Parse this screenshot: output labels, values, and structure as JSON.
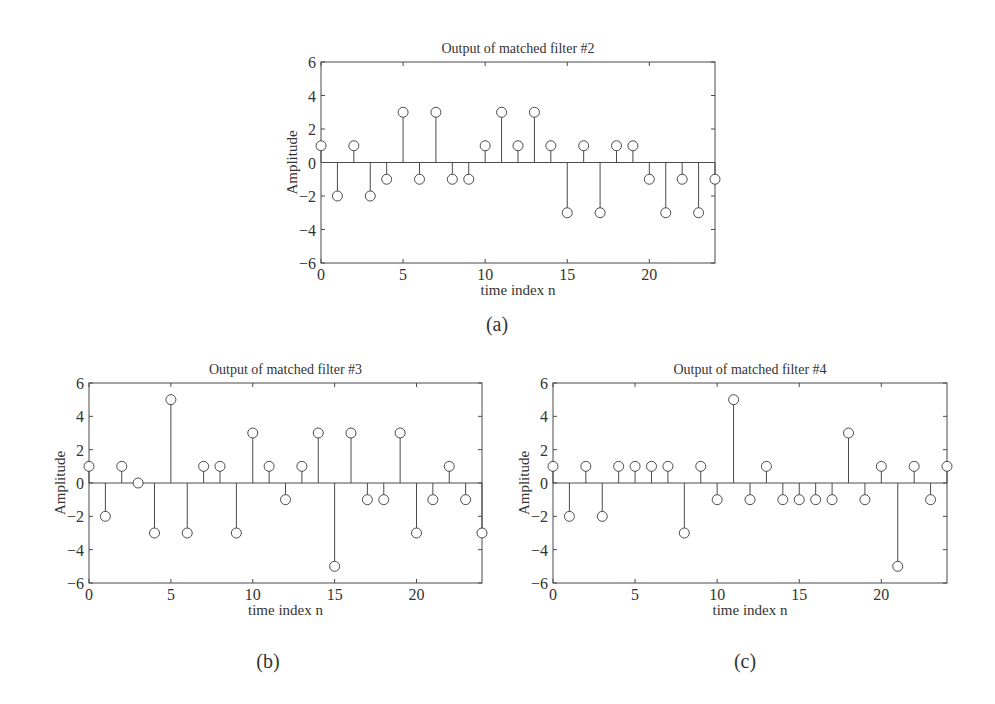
{
  "chart_data": [
    {
      "type": "stem",
      "panel_label": "(a)",
      "title": "Output of matched filter #2",
      "xlabel": "time index n",
      "ylabel": "Amplitude",
      "xlim": [
        0,
        24
      ],
      "ylim": [
        -6,
        6
      ],
      "xticks": [
        0,
        5,
        10,
        15,
        20
      ],
      "yticks": [
        -6,
        -4,
        -2,
        0,
        2,
        4,
        6
      ],
      "grid": false,
      "x": [
        0,
        1,
        2,
        3,
        4,
        5,
        6,
        7,
        8,
        9,
        10,
        11,
        12,
        13,
        14,
        15,
        16,
        17,
        18,
        19,
        20,
        21,
        22,
        23,
        24
      ],
      "values": [
        1,
        -2,
        1,
        -2,
        -1,
        3,
        -1,
        3,
        -1,
        -1,
        1,
        3,
        1,
        3,
        1,
        -3,
        1,
        -3,
        1,
        1,
        -1,
        -3,
        -1,
        -3,
        -1
      ]
    },
    {
      "type": "stem",
      "panel_label": "(b)",
      "title": "Output of matched filter #3",
      "xlabel": "time index n",
      "ylabel": "Amplitude",
      "xlim": [
        0,
        24
      ],
      "ylim": [
        -6,
        6
      ],
      "xticks": [
        0,
        5,
        10,
        15,
        20
      ],
      "yticks": [
        -6,
        -4,
        -2,
        0,
        2,
        4,
        6
      ],
      "grid": false,
      "x": [
        0,
        1,
        2,
        3,
        4,
        5,
        6,
        7,
        8,
        9,
        10,
        11,
        12,
        13,
        14,
        15,
        16,
        17,
        18,
        19,
        20,
        21,
        22,
        23,
        24
      ],
      "values": [
        1,
        -2,
        1,
        0,
        -3,
        5,
        -3,
        1,
        1,
        -3,
        3,
        1,
        -1,
        1,
        3,
        -5,
        3,
        -1,
        -1,
        3,
        -3,
        -1,
        1,
        -1,
        -3
      ]
    },
    {
      "type": "stem",
      "panel_label": "(c)",
      "title": "Output of matched filter #4",
      "xlabel": "time index n",
      "ylabel": "Amplitude",
      "xlim": [
        0,
        24
      ],
      "ylim": [
        -6,
        6
      ],
      "xticks": [
        0,
        5,
        10,
        15,
        20
      ],
      "yticks": [
        -6,
        -4,
        -2,
        0,
        2,
        4,
        6
      ],
      "grid": false,
      "x": [
        0,
        1,
        2,
        3,
        4,
        5,
        6,
        7,
        8,
        9,
        10,
        11,
        12,
        13,
        14,
        15,
        16,
        17,
        18,
        19,
        20,
        21,
        22,
        23,
        24
      ],
      "values": [
        1,
        -2,
        1,
        -2,
        1,
        1,
        1,
        1,
        -3,
        1,
        -1,
        5,
        -1,
        1,
        -1,
        -1,
        -1,
        -1,
        3,
        -1,
        1,
        -5,
        1,
        -1,
        1
      ]
    }
  ]
}
